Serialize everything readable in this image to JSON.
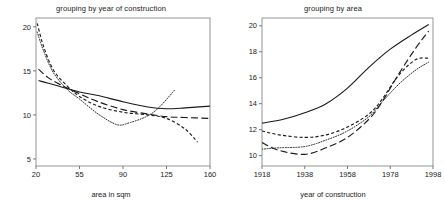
{
  "figure": {
    "background": "#ffffff",
    "ink": "#1a1a1a",
    "panel_count": 2
  },
  "chart_data": [
    {
      "type": "line",
      "panel": "left",
      "title": "grouping by year of construction",
      "xlabel": "area in sqm",
      "ylabel": "",
      "xlim": [
        20,
        160
      ],
      "ylim": [
        4.2,
        21.0
      ],
      "xticks": [
        20,
        55,
        90,
        125,
        160
      ],
      "yticks": [
        5,
        10,
        15,
        20
      ],
      "grid": false,
      "legend": "none",
      "series": [
        {
          "name": "solid",
          "style": "solid",
          "x": [
            22,
            30,
            40,
            55,
            70,
            90,
            110,
            125,
            140,
            160
          ],
          "values": [
            13.9,
            13.6,
            13.2,
            12.6,
            12.2,
            11.5,
            10.9,
            10.7,
            10.8,
            11.0
          ]
        },
        {
          "name": "long-dash",
          "style": "long-dash",
          "x": [
            22,
            30,
            40,
            55,
            70,
            90,
            110,
            125,
            140,
            160
          ],
          "values": [
            15.2,
            14.2,
            13.4,
            12.4,
            11.5,
            10.6,
            10.1,
            9.8,
            9.7,
            9.6
          ]
        },
        {
          "name": "short-dash",
          "style": "short-dash",
          "x": [
            21,
            26,
            34,
            45,
            55,
            70,
            90,
            110,
            125,
            140,
            150
          ],
          "values": [
            20.4,
            17.8,
            15.1,
            13.3,
            12.1,
            11.0,
            10.3,
            10.0,
            9.6,
            8.4,
            6.9
          ]
        },
        {
          "name": "dotted",
          "style": "dotted",
          "x": [
            21,
            26,
            34,
            45,
            55,
            70,
            85,
            95,
            110,
            120,
            132
          ],
          "values": [
            19.4,
            17.3,
            14.8,
            12.9,
            11.8,
            10.1,
            8.9,
            9.1,
            9.9,
            11.0,
            12.9
          ]
        }
      ]
    },
    {
      "type": "line",
      "panel": "right",
      "title": "grouping by area",
      "xlabel": "year of construction",
      "ylabel": "",
      "xlim": [
        1918,
        1998
      ],
      "ylim": [
        9.2,
        20.6
      ],
      "xticks": [
        1918,
        1938,
        1958,
        1978,
        1998
      ],
      "yticks": [
        10,
        12,
        14,
        16,
        18,
        20
      ],
      "grid": false,
      "legend": "none",
      "series": [
        {
          "name": "solid",
          "style": "solid",
          "x": [
            1918,
            1928,
            1938,
            1948,
            1958,
            1968,
            1978,
            1988,
            1996
          ],
          "values": [
            12.5,
            12.8,
            13.3,
            14.0,
            15.2,
            16.8,
            18.2,
            19.3,
            20.1
          ]
        },
        {
          "name": "long-dash",
          "style": "long-dash",
          "x": [
            1918,
            1926,
            1938,
            1948,
            1958,
            1968,
            1974,
            1982,
            1990,
            1996
          ],
          "values": [
            11.0,
            10.4,
            10.1,
            10.6,
            11.4,
            12.8,
            14.1,
            16.3,
            18.3,
            19.6
          ]
        },
        {
          "name": "short-dash",
          "style": "short-dash",
          "x": [
            1918,
            1926,
            1938,
            1948,
            1958,
            1968,
            1974,
            1982,
            1990,
            1996
          ],
          "values": [
            11.9,
            11.6,
            11.4,
            11.6,
            12.2,
            13.2,
            14.3,
            16.2,
            17.4,
            17.5
          ]
        },
        {
          "name": "dotted",
          "style": "dotted",
          "x": [
            1918,
            1926,
            1938,
            1948,
            1958,
            1968,
            1974,
            1982,
            1990,
            1996
          ],
          "values": [
            10.5,
            10.6,
            10.7,
            11.2,
            11.9,
            13.0,
            14.1,
            15.5,
            16.6,
            17.2
          ]
        }
      ]
    }
  ]
}
